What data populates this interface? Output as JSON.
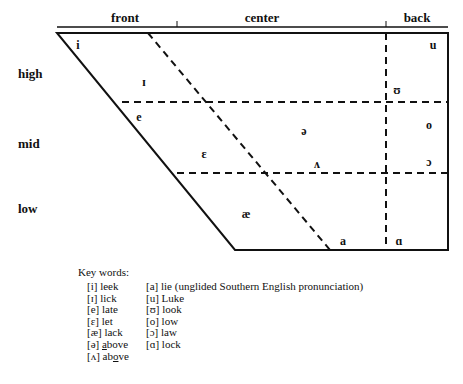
{
  "chart_data": {
    "type": "diagram",
    "column_headers": [
      {
        "label": "front",
        "x": 125
      },
      {
        "label": "center",
        "x": 262
      },
      {
        "label": "back",
        "x": 417
      }
    ],
    "row_labels": [
      {
        "label": "high",
        "x": 18,
        "y": 66
      },
      {
        "label": "mid",
        "x": 18,
        "y": 136
      },
      {
        "label": "low",
        "x": 18,
        "y": 201
      }
    ],
    "vowels": [
      {
        "symbol": "i",
        "name": "vowel-i",
        "x": 78,
        "y": 45
      },
      {
        "symbol": "ɪ",
        "name": "vowel-small-cap-i",
        "x": 144,
        "y": 82
      },
      {
        "symbol": "e",
        "name": "vowel-e",
        "x": 139,
        "y": 117
      },
      {
        "symbol": "ɛ",
        "name": "vowel-epsilon",
        "x": 204,
        "y": 154
      },
      {
        "symbol": "æ",
        "name": "vowel-ash",
        "x": 246,
        "y": 214
      },
      {
        "symbol": "ə",
        "name": "vowel-schwa",
        "x": 304,
        "y": 131
      },
      {
        "symbol": "ʌ",
        "name": "vowel-wedge",
        "x": 317,
        "y": 164
      },
      {
        "symbol": "a",
        "name": "vowel-a",
        "x": 343,
        "y": 241
      },
      {
        "symbol": "u",
        "name": "vowel-u",
        "x": 433,
        "y": 45
      },
      {
        "symbol": "ʊ",
        "name": "vowel-upsilon",
        "x": 397,
        "y": 90
      },
      {
        "symbol": "o",
        "name": "vowel-o",
        "x": 429,
        "y": 125
      },
      {
        "symbol": "ɔ",
        "name": "vowel-open-o",
        "x": 429,
        "y": 162
      },
      {
        "symbol": "ɑ",
        "name": "vowel-script-a",
        "x": 399,
        "y": 241
      }
    ],
    "geometry": {
      "outline": "57,33 448,33 448,250 235,250",
      "top_y": 33,
      "bottom_y": 250,
      "left_top_x": 57,
      "left_bottom_x": 235,
      "right_x": 448,
      "dashed_diagonal": "148,33 330,250",
      "dashed_horizontals": [
        {
          "x1": 122,
          "y": 102,
          "x2": 448
        },
        {
          "x1": 177,
          "y": 173,
          "x2": 448
        }
      ],
      "dashed_vertical": {
        "x": 386,
        "y1": 33,
        "y2": 250
      },
      "header_rule": {
        "x1": 57,
        "y": 27,
        "x2": 448
      },
      "header_ticks": [
        {
          "x": 177,
          "y1": 21,
          "y2": 33
        },
        {
          "x": 386,
          "y1": 21,
          "y2": 33
        }
      ]
    },
    "colors": {
      "stroke": "#111111",
      "background": "#ffffff",
      "text": "#111111"
    }
  },
  "key_words": {
    "title": "Key words:",
    "left_column": [
      {
        "symbol": "[i]",
        "word": "leek",
        "underline": ""
      },
      {
        "symbol": "[ɪ]",
        "word": "lick",
        "underline": ""
      },
      {
        "symbol": "[e]",
        "word": "late",
        "underline": ""
      },
      {
        "symbol": "[ɛ]",
        "word": "let",
        "underline": ""
      },
      {
        "symbol": "[æ]",
        "word": "lack",
        "underline": ""
      },
      {
        "symbol": "[ə]",
        "word": "above",
        "underline": "a"
      },
      {
        "symbol": "[ʌ]",
        "word": "above",
        "underline": "o"
      }
    ],
    "right_column": [
      {
        "symbol": "[a]",
        "word": "lie (unglided Southern English pronunciation)",
        "underline": ""
      },
      {
        "symbol": "[u]",
        "word": "Luke",
        "underline": ""
      },
      {
        "symbol": "[ʊ]",
        "word": "look",
        "underline": ""
      },
      {
        "symbol": "[o]",
        "word": "low",
        "underline": ""
      },
      {
        "symbol": "[ɔ]",
        "word": "law",
        "underline": ""
      },
      {
        "symbol": "[ɑ]",
        "word": "lock",
        "underline": ""
      }
    ]
  }
}
